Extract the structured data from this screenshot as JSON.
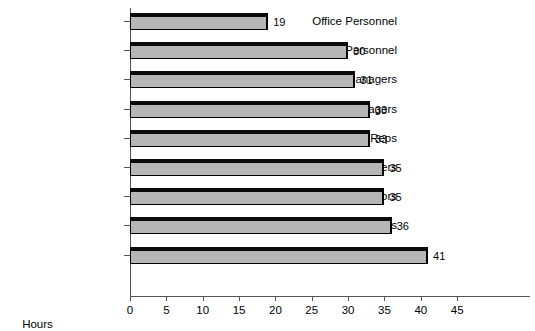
{
  "chart_data": {
    "type": "bar",
    "orientation": "horizontal",
    "title": "",
    "subtitle": "",
    "xlabel": "Hours",
    "ylabel": "",
    "xlim": [
      0,
      45
    ],
    "xticks": [
      0,
      5,
      10,
      15,
      20,
      25,
      30,
      35,
      40,
      45
    ],
    "grid": false,
    "legend": null,
    "data_labels": true,
    "categories": [
      "Office Personnel",
      "Production Personnel",
      "Senior Managers",
      "Executive Managers",
      "Customer Service Reps",
      "Middle Managers",
      "Supervisors",
      "Professionals",
      "Sales Reps"
    ],
    "values": [
      19,
      30,
      31,
      33,
      33,
      35,
      35,
      36,
      41
    ],
    "value_labels": [
      "19",
      "30",
      "31",
      "33",
      "33",
      "35",
      "35",
      "36",
      "41"
    ],
    "colors": {
      "bar_fill": "#b6b6b6",
      "bar_border": "#000000",
      "axis": "#555555",
      "text": "#000000",
      "background": "#ffffff"
    }
  }
}
